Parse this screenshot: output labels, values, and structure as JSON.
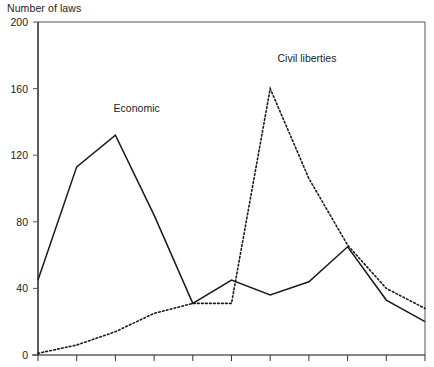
{
  "chart_data": {
    "type": "line",
    "title": "",
    "ylabel": "Number of laws",
    "xlabel": "",
    "ylim": [
      0,
      200
    ],
    "yticks": [
      0,
      40,
      80,
      120,
      160,
      200
    ],
    "ytick_labels": [
      "0",
      "40",
      "80",
      "120",
      "160",
      "200"
    ],
    "xticks_count": 11,
    "xtick_labels": [],
    "grid": false,
    "legend_position": "inline-annotations",
    "annotations": [
      {
        "text": "Economic",
        "x_index": 2.55,
        "value": 148
      },
      {
        "text": "Civil liberties",
        "x_index": 6.95,
        "value": 178
      }
    ],
    "series": [
      {
        "name": "Economic",
        "style": "solid",
        "color": "#1a1a1a",
        "x": [
          0,
          1,
          2,
          3,
          4,
          5,
          6,
          7,
          8,
          9,
          10
        ],
        "values": [
          45,
          113,
          132,
          84,
          31,
          45,
          36,
          44,
          65,
          33,
          20
        ]
      },
      {
        "name": "Civil liberties",
        "style": "dotted",
        "color": "#1a1a1a",
        "x": [
          0,
          1,
          2,
          3,
          4,
          5,
          6,
          7,
          8,
          9,
          10
        ],
        "values": [
          1,
          6,
          14,
          25,
          31,
          31,
          160,
          106,
          66,
          40,
          28
        ]
      }
    ]
  },
  "plot": {
    "left": 38,
    "right": 425,
    "top": 22,
    "bottom": 355
  },
  "icons": {
    "chart_area": "line-chart-icon"
  }
}
